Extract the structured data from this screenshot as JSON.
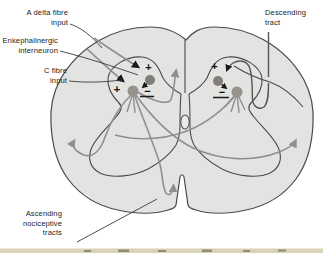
{
  "figure": {
    "labels": {
      "a_delta": {
        "line1": "A delta fibre",
        "line2": "input"
      },
      "enkephalinergic": {
        "line1": "Enkephalinergic",
        "line2": "interneuron"
      },
      "c_fibre": {
        "line1": "C fibre",
        "line2": "input"
      },
      "descending": {
        "line1": "Descending",
        "line2": "tract"
      },
      "ascending": {
        "line1": "Ascending",
        "line2": "nociceptive",
        "line3": "tracts"
      }
    },
    "signs": {
      "plus": "+",
      "minus": "−"
    },
    "colors": {
      "cord_fill": "#e3e3e1",
      "outline_gray": "#4a4a4a",
      "tract_gray": "#8f8f8f",
      "descending_line": "#555555",
      "synapse_black": "#1a1a1a",
      "interneuron_fill": "#827d77",
      "projection_neuron_fill": "#97928c",
      "bottom_strip": "#d9d2b4"
    }
  }
}
